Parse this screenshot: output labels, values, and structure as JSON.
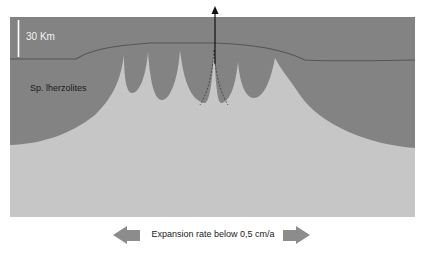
{
  "diagram": {
    "scale_bar": {
      "label": "30 Km"
    },
    "rock_label": "Sp. lherzolites",
    "caption": "Expansion rate below 0,5 cm/a",
    "arrows": {
      "left": "left-arrow",
      "right": "right-arrow",
      "up": "up-arrow"
    },
    "colors": {
      "lithosphere": "#838383",
      "asthenosphere": "#c6c6c6",
      "moho_line": "#555555",
      "arrows": "#8c8c8c",
      "scale_bar": "#ffffff"
    }
  }
}
